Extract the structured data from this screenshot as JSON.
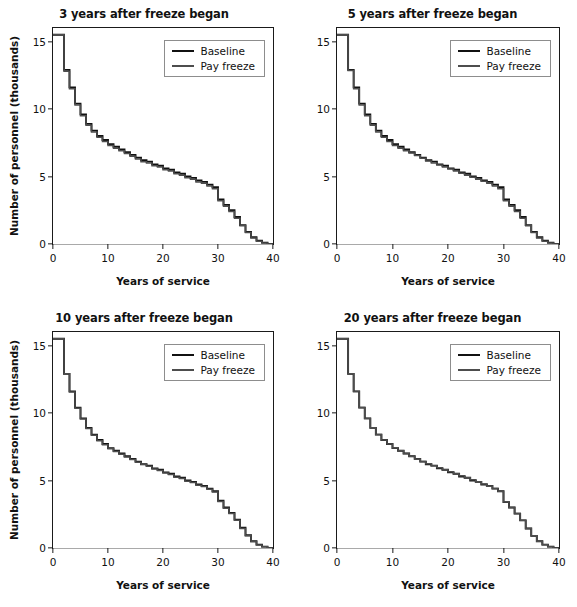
{
  "figure": {
    "axis": {
      "xlabel": "Years of service",
      "ylabel": "Number of personnel (thousands)",
      "xticks": [
        "0",
        "10",
        "20",
        "30",
        "40"
      ],
      "yticks": [
        "0",
        "5",
        "10",
        "15"
      ]
    },
    "legend": {
      "items": [
        {
          "label": "Baseline",
          "color": "#111111"
        },
        {
          "label": "Pay freeze",
          "color": "#4d4d4d"
        }
      ]
    },
    "panels": [
      {
        "title": "3 years after freeze began"
      },
      {
        "title": "5 years after freeze began"
      },
      {
        "title": "10 years after freeze began"
      },
      {
        "title": "20 years after freeze began"
      }
    ]
  },
  "chart_data": [
    {
      "type": "line",
      "subtype": "step",
      "title": "3 years after freeze began",
      "xlabel": "Years of service",
      "ylabel": "Number of personnel (thousands)",
      "xlim": [
        0,
        40
      ],
      "ylim": [
        0,
        16
      ],
      "xticks": [
        0,
        10,
        20,
        30,
        40
      ],
      "yticks": [
        0,
        5,
        10,
        15
      ],
      "grid": false,
      "legend_position": "top-right",
      "x": [
        0,
        1,
        2,
        3,
        4,
        5,
        6,
        7,
        8,
        9,
        10,
        11,
        12,
        13,
        14,
        15,
        16,
        17,
        18,
        19,
        20,
        21,
        22,
        23,
        24,
        25,
        26,
        27,
        28,
        29,
        30,
        31,
        32,
        33,
        34,
        35,
        36,
        37,
        38,
        39,
        40
      ],
      "series": [
        {
          "name": "Baseline",
          "color": "#111111",
          "values": [
            15.5,
            15.5,
            12.9,
            11.6,
            10.4,
            9.6,
            8.9,
            8.4,
            8.0,
            7.7,
            7.4,
            7.2,
            7.0,
            6.8,
            6.6,
            6.4,
            6.2,
            6.1,
            5.9,
            5.8,
            5.6,
            5.5,
            5.3,
            5.2,
            5.0,
            4.9,
            4.7,
            4.6,
            4.4,
            4.2,
            3.3,
            2.9,
            2.5,
            2.0,
            1.4,
            0.9,
            0.5,
            0.25,
            0.1,
            0.0,
            0.0
          ]
        },
        {
          "name": "Pay freeze",
          "color": "#4d4d4d",
          "values": [
            15.5,
            15.5,
            12.8,
            11.5,
            10.3,
            9.5,
            8.8,
            8.3,
            7.9,
            7.6,
            7.3,
            7.1,
            6.9,
            6.7,
            6.5,
            6.3,
            6.1,
            6.0,
            5.8,
            5.7,
            5.5,
            5.4,
            5.2,
            5.1,
            4.9,
            4.8,
            4.6,
            4.5,
            4.3,
            4.1,
            3.2,
            2.8,
            2.4,
            1.9,
            1.35,
            0.85,
            0.45,
            0.2,
            0.08,
            0.0,
            0.0
          ]
        }
      ]
    },
    {
      "type": "line",
      "subtype": "step",
      "title": "5 years after freeze began",
      "xlabel": "Years of service",
      "ylabel": "Number of personnel (thousands)",
      "xlim": [
        0,
        40
      ],
      "ylim": [
        0,
        16
      ],
      "xticks": [
        0,
        10,
        20,
        30,
        40
      ],
      "yticks": [
        0,
        5,
        10,
        15
      ],
      "grid": false,
      "legend_position": "top-right",
      "x": [
        0,
        1,
        2,
        3,
        4,
        5,
        6,
        7,
        8,
        9,
        10,
        11,
        12,
        13,
        14,
        15,
        16,
        17,
        18,
        19,
        20,
        21,
        22,
        23,
        24,
        25,
        26,
        27,
        28,
        29,
        30,
        31,
        32,
        33,
        34,
        35,
        36,
        37,
        38,
        39,
        40
      ],
      "series": [
        {
          "name": "Baseline",
          "color": "#111111",
          "values": [
            15.5,
            15.5,
            12.9,
            11.6,
            10.4,
            9.6,
            8.9,
            8.4,
            8.0,
            7.7,
            7.4,
            7.2,
            7.0,
            6.8,
            6.6,
            6.4,
            6.2,
            6.1,
            5.9,
            5.8,
            5.6,
            5.5,
            5.3,
            5.2,
            5.0,
            4.9,
            4.7,
            4.6,
            4.4,
            4.2,
            3.3,
            2.9,
            2.5,
            2.0,
            1.4,
            0.9,
            0.5,
            0.25,
            0.1,
            0.0,
            0.0
          ]
        },
        {
          "name": "Pay freeze",
          "color": "#4d4d4d",
          "values": [
            15.5,
            15.5,
            12.85,
            11.5,
            10.3,
            9.5,
            8.8,
            8.3,
            7.9,
            7.6,
            7.3,
            7.1,
            6.9,
            6.75,
            6.55,
            6.35,
            6.15,
            6.0,
            5.85,
            5.7,
            5.55,
            5.4,
            5.25,
            5.1,
            4.95,
            4.8,
            4.65,
            4.5,
            4.3,
            4.1,
            3.2,
            2.8,
            2.4,
            1.9,
            1.35,
            0.85,
            0.45,
            0.2,
            0.08,
            0.0,
            0.0
          ]
        }
      ]
    },
    {
      "type": "line",
      "subtype": "step",
      "title": "10 years after freeze began",
      "xlabel": "Years of service",
      "ylabel": "Number of personnel (thousands)",
      "xlim": [
        0,
        40
      ],
      "ylim": [
        0,
        16
      ],
      "xticks": [
        0,
        10,
        20,
        30,
        40
      ],
      "yticks": [
        0,
        5,
        10,
        15
      ],
      "grid": false,
      "legend_position": "top-right",
      "x": [
        0,
        1,
        2,
        3,
        4,
        5,
        6,
        7,
        8,
        9,
        10,
        11,
        12,
        13,
        14,
        15,
        16,
        17,
        18,
        19,
        20,
        21,
        22,
        23,
        24,
        25,
        26,
        27,
        28,
        29,
        30,
        31,
        32,
        33,
        34,
        35,
        36,
        37,
        38,
        39,
        40
      ],
      "series": [
        {
          "name": "Baseline",
          "color": "#111111",
          "values": [
            15.5,
            15.5,
            12.9,
            11.6,
            10.4,
            9.6,
            8.9,
            8.4,
            8.0,
            7.7,
            7.4,
            7.2,
            7.0,
            6.8,
            6.6,
            6.4,
            6.2,
            6.1,
            5.9,
            5.8,
            5.6,
            5.5,
            5.3,
            5.2,
            5.0,
            4.9,
            4.7,
            4.6,
            4.4,
            4.2,
            3.5,
            3.0,
            2.6,
            2.1,
            1.5,
            0.95,
            0.5,
            0.25,
            0.1,
            0.0,
            0.0
          ]
        },
        {
          "name": "Pay freeze",
          "color": "#4d4d4d",
          "values": [
            15.5,
            15.5,
            12.9,
            11.55,
            10.35,
            9.55,
            8.85,
            8.35,
            7.95,
            7.65,
            7.35,
            7.15,
            6.95,
            6.75,
            6.55,
            6.35,
            6.2,
            6.05,
            5.85,
            5.75,
            5.55,
            5.45,
            5.25,
            5.15,
            4.95,
            4.85,
            4.65,
            4.55,
            4.35,
            4.15,
            3.45,
            2.95,
            2.55,
            2.05,
            1.45,
            0.9,
            0.48,
            0.23,
            0.09,
            0.0,
            0.0
          ]
        }
      ]
    },
    {
      "type": "line",
      "subtype": "step",
      "title": "20 years after freeze began",
      "xlabel": "Years of service",
      "ylabel": "Number of personnel (thousands)",
      "xlim": [
        0,
        40
      ],
      "ylim": [
        0,
        16
      ],
      "xticks": [
        0,
        10,
        20,
        30,
        40
      ],
      "yticks": [
        0,
        5,
        10,
        15
      ],
      "grid": false,
      "legend_position": "top-right",
      "x": [
        0,
        1,
        2,
        3,
        4,
        5,
        6,
        7,
        8,
        9,
        10,
        11,
        12,
        13,
        14,
        15,
        16,
        17,
        18,
        19,
        20,
        21,
        22,
        23,
        24,
        25,
        26,
        27,
        28,
        29,
        30,
        31,
        32,
        33,
        34,
        35,
        36,
        37,
        38,
        39,
        40
      ],
      "series": [
        {
          "name": "Baseline",
          "color": "#111111",
          "values": [
            15.5,
            15.5,
            12.9,
            11.6,
            10.4,
            9.6,
            8.9,
            8.4,
            8.0,
            7.7,
            7.4,
            7.2,
            7.0,
            6.8,
            6.6,
            6.4,
            6.2,
            6.1,
            5.9,
            5.8,
            5.6,
            5.5,
            5.3,
            5.2,
            5.0,
            4.9,
            4.7,
            4.6,
            4.4,
            4.2,
            3.4,
            3.0,
            2.55,
            2.05,
            1.45,
            0.9,
            0.5,
            0.25,
            0.1,
            0.0,
            0.0
          ]
        },
        {
          "name": "Pay freeze",
          "color": "#4d4d4d",
          "values": [
            15.5,
            15.5,
            12.9,
            11.6,
            10.4,
            9.6,
            8.9,
            8.4,
            8.0,
            7.7,
            7.4,
            7.2,
            7.0,
            6.8,
            6.6,
            6.4,
            6.25,
            6.1,
            5.95,
            5.8,
            5.65,
            5.5,
            5.35,
            5.2,
            5.05,
            4.9,
            4.75,
            4.6,
            4.4,
            4.2,
            3.4,
            3.0,
            2.55,
            2.05,
            1.45,
            0.9,
            0.5,
            0.25,
            0.1,
            0.0,
            0.0
          ]
        }
      ]
    }
  ]
}
